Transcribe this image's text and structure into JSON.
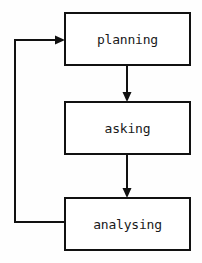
{
  "diagram": {
    "type": "flowchart",
    "orientation": "vertical",
    "background_color": "#fefefe",
    "line_color": "#111111",
    "text_color": "#1a1a1a",
    "nodes": [
      {
        "id": "planning",
        "label": "planning",
        "shape": "rectangle",
        "x": 65,
        "y": 13,
        "width": 125,
        "height": 52
      },
      {
        "id": "asking",
        "label": "asking",
        "shape": "rectangle",
        "x": 65,
        "y": 102,
        "width": 125,
        "height": 52
      },
      {
        "id": "analysing",
        "label": "analysing",
        "shape": "rectangle",
        "x": 65,
        "y": 198,
        "width": 125,
        "height": 52
      }
    ],
    "edges": [
      {
        "id": "planning-to-asking",
        "from": "planning",
        "to": "asking",
        "style": "straight-down",
        "arrow": true,
        "label": ""
      },
      {
        "id": "asking-to-analysing",
        "from": "asking",
        "to": "analysing",
        "style": "straight-down",
        "arrow": true,
        "label": ""
      },
      {
        "id": "analysing-to-planning",
        "from": "analysing",
        "to": "planning",
        "style": "feedback-loop-left",
        "arrow": true,
        "label": ""
      }
    ]
  }
}
